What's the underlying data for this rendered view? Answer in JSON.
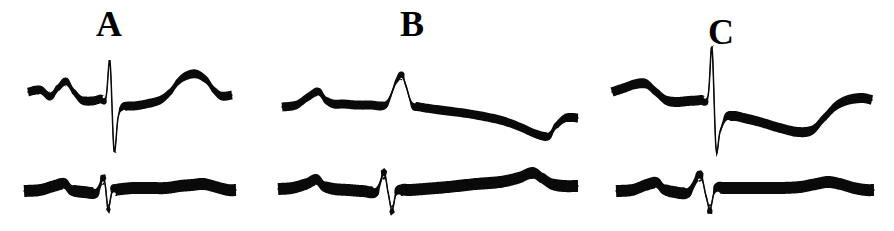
{
  "figure": {
    "type": "ecg-trace-figure",
    "background_color": "#ffffff",
    "trace_color": "#0a0a0a",
    "width": 894,
    "height": 231,
    "panel_count": 3,
    "rows_per_panel": 2
  },
  "panels": [
    {
      "id": "a",
      "label": "A",
      "top_trace_name": "upper-ecg-trace-a",
      "bottom_trace_name": "lower-ecg-trace-a",
      "description": "Tall narrow biphasic QRS with deep negative deflection and broad positive T wave"
    },
    {
      "id": "b",
      "label": "B",
      "top_trace_name": "upper-ecg-trace-b",
      "bottom_trace_name": "lower-ecg-trace-b",
      "description": "Sharp small positive spike with long slowly descending baseline and terminal notch"
    },
    {
      "id": "c",
      "label": "C",
      "top_trace_name": "upper-ecg-trace-c",
      "bottom_trace_name": "lower-ecg-trace-c",
      "description": "Tall narrow positive R wave with deep S wave and gradual recovery"
    }
  ],
  "chart_data": {
    "type": "line",
    "title": "",
    "xlabel": "",
    "ylabel": "",
    "grid": false,
    "legend": null,
    "axis_visible": false,
    "series": [
      {
        "name": "A-upper",
        "panel": "A",
        "row": "upper",
        "stroke_width": 9,
        "x": [
          28,
          40,
          50,
          58,
          66,
          74,
          82,
          92,
          100,
          106,
          110,
          114,
          118,
          122,
          128,
          134,
          146,
          160,
          170,
          178,
          186,
          196,
          206,
          214,
          222,
          232
        ],
        "y": [
          92,
          90,
          96,
          88,
          82,
          92,
          100,
          101,
          99,
          97,
          62,
          150,
          118,
          108,
          106,
          106,
          104,
          100,
          92,
          82,
          76,
          74,
          80,
          90,
          96,
          95
        ]
      },
      {
        "name": "A-lower",
        "panel": "A",
        "row": "lower",
        "stroke_width": 12,
        "x": [
          24,
          40,
          54,
          64,
          72,
          84,
          96,
          104,
          108,
          112,
          116,
          122,
          134,
          150,
          166,
          180,
          192,
          204,
          216,
          228,
          236
        ],
        "y": [
          191,
          190,
          186,
          184,
          190,
          192,
          192,
          180,
          208,
          192,
          190,
          189,
          188,
          188,
          188,
          186,
          185,
          184,
          187,
          190,
          190
        ]
      },
      {
        "name": "B-upper",
        "panel": "B",
        "row": "upper",
        "stroke_width": 9,
        "x": [
          282,
          296,
          308,
          318,
          326,
          334,
          344,
          356,
          370,
          386,
          396,
          402,
          406,
          412,
          420,
          440,
          470,
          500,
          520,
          536,
          548,
          556,
          566,
          578
        ],
        "y": [
          107,
          105,
          97,
          92,
          100,
          104,
          104,
          105,
          105,
          104,
          82,
          76,
          86,
          104,
          107,
          110,
          114,
          120,
          127,
          134,
          136,
          126,
          118,
          118
        ]
      },
      {
        "name": "B-lower",
        "panel": "B",
        "row": "lower",
        "stroke_width": 12,
        "x": [
          278,
          292,
          306,
          316,
          324,
          334,
          348,
          362,
          376,
          384,
          388,
          392,
          396,
          402,
          410,
          424,
          448,
          476,
          500,
          518,
          532,
          542,
          552,
          564,
          578
        ],
        "y": [
          189,
          188,
          184,
          180,
          186,
          189,
          190,
          191,
          191,
          174,
          192,
          210,
          194,
          190,
          190,
          189,
          187,
          184,
          182,
          178,
          173,
          178,
          184,
          186,
          186
        ]
      },
      {
        "name": "C-upper",
        "panel": "C",
        "row": "upper",
        "stroke_width": 10,
        "x": [
          612,
          624,
          636,
          646,
          656,
          666,
          676,
          688,
          700,
          708,
          712,
          716,
          720,
          726,
          734,
          744,
          760,
          780,
          798,
          812,
          824,
          836,
          848,
          862,
          872
        ],
        "y": [
          92,
          88,
          84,
          84,
          92,
          100,
          102,
          101,
          100,
          96,
          48,
          148,
          132,
          118,
          116,
          118,
          122,
          128,
          132,
          130,
          118,
          106,
          100,
          98,
          100
        ]
      },
      {
        "name": "C-lower",
        "panel": "C",
        "row": "lower",
        "stroke_width": 12,
        "x": [
          616,
          632,
          646,
          656,
          664,
          674,
          688,
          700,
          706,
          710,
          714,
          718,
          724,
          736,
          756,
          780,
          800,
          816,
          828,
          840,
          854,
          866,
          874
        ],
        "y": [
          191,
          190,
          185,
          183,
          189,
          192,
          192,
          176,
          196,
          209,
          193,
          188,
          188,
          188,
          188,
          188,
          187,
          184,
          182,
          184,
          188,
          190,
          190
        ]
      }
    ]
  }
}
